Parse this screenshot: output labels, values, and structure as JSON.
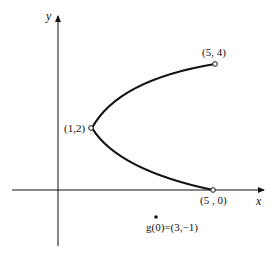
{
  "axes": {
    "x_label": "x",
    "y_label": "y"
  },
  "points": {
    "vertex": "(1,2)",
    "upper_end": "(5, 4)",
    "lower_end": "(5, 0)",
    "g_point": "g(0) = (3, −1)"
  },
  "labels": {
    "vertex": "(1,2)",
    "upper_end": "(5, 4)",
    "lower_end": "(5 , 0)",
    "g_point_fn": "g",
    "g_point_rest": "(0)=(3,−1)"
  },
  "colors": {
    "ink": "#111111",
    "background": "#ffffff"
  }
}
